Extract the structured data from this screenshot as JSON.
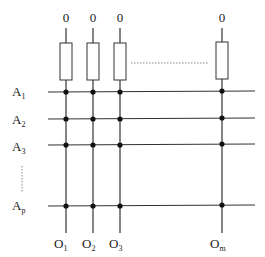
{
  "diagram": {
    "type": "crossbar-array",
    "top_labels": [
      "0",
      "0",
      "0",
      "0"
    ],
    "row_labels": [
      {
        "main": "A",
        "sub": "1"
      },
      {
        "main": "A",
        "sub": "2"
      },
      {
        "main": "A",
        "sub": "3"
      },
      {
        "main": "A",
        "sub": "p"
      }
    ],
    "column_labels": [
      {
        "main": "O",
        "sub": "1"
      },
      {
        "main": "O",
        "sub": "2"
      },
      {
        "main": "O",
        "sub": "3"
      },
      {
        "main": "O",
        "sub": "m"
      }
    ],
    "components": {
      "resistors_count": 4,
      "junction_dots": 16,
      "ellipsis_horizontal": "between column 3 and column m",
      "ellipsis_vertical": "between row 3 and row p"
    },
    "colors": {
      "line": "#333333",
      "dot": "#111111",
      "dotted": "#888888"
    }
  }
}
